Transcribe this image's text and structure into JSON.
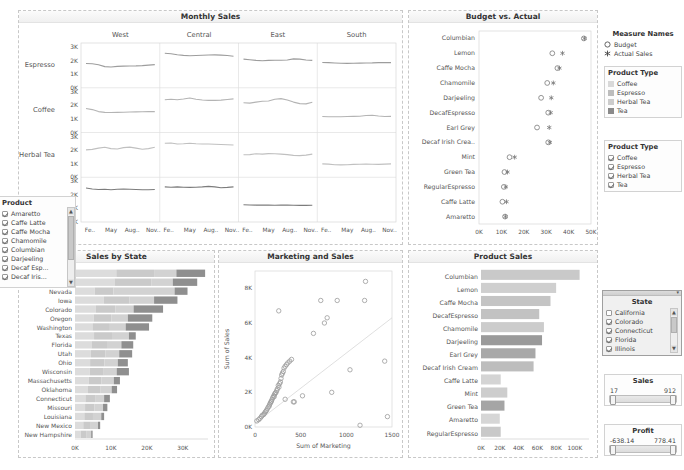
{
  "panels": {
    "monthly_sales": {
      "title": "Monthly Sales"
    },
    "budget_actual": {
      "title": "Budget vs. Actual"
    },
    "sales_by_state": {
      "title": "Sales by State"
    },
    "marketing_sales": {
      "title": "Marketing and Sales"
    },
    "product_sales": {
      "title": "Product Sales"
    }
  },
  "sidebar": {
    "measure_names": {
      "title": "Measure Names",
      "items": [
        {
          "label": "Budget",
          "icon": "hollow-circle-icon"
        },
        {
          "label": "Actual Sales",
          "icon": "asterisk-icon"
        }
      ]
    },
    "product_type_legend": {
      "title": "Product Type",
      "items": [
        {
          "label": "Coffee",
          "color": "#d9d9d9"
        },
        {
          "label": "Espresso",
          "color": "#bdbdbd"
        },
        {
          "label": "Herbal Tea",
          "color": "#cccccc"
        },
        {
          "label": "Tea",
          "color": "#8a8a8a"
        }
      ]
    },
    "product_type_filter": {
      "title": "Product Type",
      "items": [
        {
          "label": "Coffee",
          "checked": true
        },
        {
          "label": "Espresso",
          "checked": true
        },
        {
          "label": "Herbal Tea",
          "checked": true
        },
        {
          "label": "Tea",
          "checked": true
        }
      ]
    },
    "product_filter": {
      "title": "Product",
      "items": [
        {
          "label": "Amaretto",
          "checked": true
        },
        {
          "label": "Caffe Latte",
          "checked": true
        },
        {
          "label": "Caffe Mocha",
          "checked": true
        },
        {
          "label": "Chamomile",
          "checked": true
        },
        {
          "label": "Columbian",
          "checked": true
        },
        {
          "label": "Darjeeling",
          "checked": true
        },
        {
          "label": "Decaf Esp...",
          "checked": true
        },
        {
          "label": "Decaf Iris...",
          "checked": true
        }
      ]
    },
    "state_filter": {
      "title": "State",
      "items": [
        {
          "label": "California",
          "checked": false
        },
        {
          "label": "Colorado",
          "checked": true
        },
        {
          "label": "Connecticut",
          "checked": true
        },
        {
          "label": "Florida",
          "checked": true
        },
        {
          "label": "Illinois",
          "checked": true
        }
      ]
    },
    "sales_slider": {
      "title": "Sales",
      "min": "17",
      "max": "912"
    },
    "profit_slider": {
      "title": "Profit",
      "min": "-638.14",
      "max": "778.41"
    }
  },
  "chart_data": [
    {
      "type": "line",
      "name": "monthly_sales",
      "title": "Monthly Sales",
      "columns": [
        "West",
        "Central",
        "East",
        "South"
      ],
      "rows": [
        "Espresso",
        "Coffee",
        "Herbal Tea",
        "Tea"
      ],
      "xlabel": "",
      "ylabel": "",
      "ylim": [
        0,
        3000
      ],
      "yticks": [
        "0K",
        "1K",
        "2K",
        "3K"
      ],
      "xticks": [
        "Fe..",
        "May",
        "Aug..",
        "Nov.."
      ],
      "grid": false,
      "series": [
        {
          "row": "Espresso",
          "col": "West",
          "values": [
            1720,
            1700,
            1620,
            1480,
            1450,
            1500,
            1520,
            1530,
            1540,
            1560,
            1600,
            1640
          ]
        },
        {
          "row": "Espresso",
          "col": "Central",
          "values": [
            2520,
            2480,
            2400,
            2350,
            2330,
            2340,
            2360,
            2380,
            2390,
            2370,
            2340,
            2280
          ]
        },
        {
          "row": "Espresso",
          "col": "East",
          "values": [
            2060,
            2020,
            1960,
            1940,
            1960,
            1980,
            1970,
            1990,
            2080,
            2060,
            1990,
            1960
          ]
        },
        {
          "row": "Espresso",
          "col": "South",
          "values": [
            1800,
            1790,
            1760,
            1740,
            1730,
            1740,
            1750,
            1760,
            1770,
            1790,
            1800,
            1790
          ]
        },
        {
          "row": "Coffee",
          "col": "West",
          "values": [
            1700,
            1620,
            1460,
            1400,
            1390,
            1400,
            1420,
            1430,
            1440,
            1450,
            1460,
            1460
          ]
        },
        {
          "row": "Coffee",
          "col": "Central",
          "values": [
            2380,
            2420,
            2380,
            2440,
            2520,
            2420,
            2360,
            2330,
            2330,
            2350,
            2400,
            2450
          ]
        },
        {
          "row": "Coffee",
          "col": "East",
          "values": [
            2150,
            2120,
            2200,
            2260,
            2280,
            2420,
            2470,
            2360,
            2200,
            2080,
            2060,
            2180
          ]
        },
        {
          "row": "Coffee",
          "col": "South",
          "values": [
            1080,
            1060,
            1060,
            1070,
            1080,
            1090,
            1110,
            1160,
            1180,
            1120,
            1080,
            1090
          ]
        },
        {
          "row": "Herbal Tea",
          "col": "West",
          "values": [
            1960,
            2000,
            2100,
            2160,
            2060,
            2030,
            2140,
            2180,
            2100,
            2020,
            2060,
            2160
          ]
        },
        {
          "row": "Herbal Tea",
          "col": "Central",
          "values": [
            2480,
            2500,
            2420,
            2440,
            2480,
            2440,
            2420,
            2420,
            2400,
            2380,
            2360,
            2340
          ]
        },
        {
          "row": "Herbal Tea",
          "col": "East",
          "values": [
            1580,
            1600,
            1660,
            1640,
            1680,
            1660,
            1640,
            1600,
            1540,
            1520,
            1560,
            1640
          ]
        },
        {
          "row": "Herbal Tea",
          "col": "South",
          "values": [
            880,
            860,
            820,
            800,
            820,
            840,
            850,
            860,
            850,
            840,
            860,
            880
          ]
        },
        {
          "row": "Tea",
          "col": "West",
          "values": [
            2480,
            2400,
            2360,
            2380,
            2340,
            2380,
            2400,
            2380,
            2360,
            2340,
            2340,
            2360
          ]
        },
        {
          "row": "Tea",
          "col": "Central",
          "values": [
            2560,
            2540,
            2560,
            2540,
            2520,
            2540,
            2560,
            2600,
            2560,
            2500,
            2520,
            2560
          ]
        },
        {
          "row": "Tea",
          "col": "East",
          "values": [
            1180,
            1160,
            1150,
            1160,
            1150,
            1140,
            1160,
            1150,
            1140,
            1130,
            1130,
            1140
          ]
        },
        {
          "row": "Tea",
          "col": "South",
          "values": []
        }
      ]
    },
    {
      "type": "scatter",
      "name": "budget_actual",
      "title": "Budget vs. Actual",
      "categories": [
        "Columbian",
        "Lemon",
        "Caffe Mocha",
        "Chamomile",
        "Darjeeling",
        "DecafEspresso",
        "Earl Grey",
        "Decaf Irish Crea..",
        "Mint",
        "Green Tea",
        "RegularEspresso",
        "Caffe Latte",
        "Amaretto"
      ],
      "xlabel": "",
      "xlim": [
        0,
        55000
      ],
      "xticks": [
        "0K",
        "10K",
        "20K",
        "30K",
        "40K",
        "50K"
      ],
      "grid": false,
      "series": [
        {
          "name": "Budget",
          "values": [
            51500,
            36000,
            38500,
            33500,
            30500,
            34000,
            28500,
            34000,
            15000,
            12500,
            12200,
            11500,
            12800
          ]
        },
        {
          "name": "Actual Sales",
          "values": [
            51800,
            41000,
            39500,
            36500,
            35500,
            35200,
            34500,
            34800,
            17500,
            14000,
            13200,
            13500,
            13000
          ]
        }
      ]
    },
    {
      "type": "bar",
      "name": "sales_by_state",
      "title": "Sales by State",
      "orientation": "horizontal",
      "stacked": true,
      "categories": [
        "New York",
        "Illinois",
        "Nevada",
        "Iowa",
        "Colorado",
        "Oregon",
        "Washington",
        "Texas",
        "Florida",
        "Utah",
        "Ohio",
        "Wisconsin",
        "Massachusetts",
        "Oklahoma",
        "Connecticut",
        "Missouri",
        "Louisiana",
        "New Mexico",
        "New Hampshire"
      ],
      "xlabel": "",
      "xlim": [
        0,
        37000
      ],
      "xticks": [
        "0K",
        "10K",
        "20K",
        "30K"
      ],
      "grid": false,
      "series": [
        {
          "name": "Coffee",
          "values": [
            11500,
            11000,
            5500,
            8000,
            5800,
            5200,
            5000,
            5300,
            4600,
            4400,
            4200,
            4100,
            3800,
            3600,
            2900,
            2800,
            2600,
            2300,
            1600
          ]
        },
        {
          "name": "Espresso",
          "values": [
            10500,
            10200,
            5200,
            7200,
            5400,
            4900,
            4700,
            5000,
            4300,
            4100,
            4000,
            3900,
            3600,
            3400,
            2700,
            2600,
            2400,
            2100,
            1500
          ]
        },
        {
          "name": "Herbal Tea",
          "values": [
            6200,
            6000,
            17000,
            6800,
            5100,
            4600,
            4400,
            4700,
            4000,
            3800,
            3700,
            3600,
            3400,
            3200,
            2500,
            2400,
            2300,
            2000,
            1400
          ]
        },
        {
          "name": "Tea",
          "values": [
            8000,
            6800,
            3600,
            6500,
            8200,
            6800,
            6500,
            1900,
            3300,
            3600,
            2800,
            3400,
            1700,
            1500,
            1600,
            1200,
            800,
            600,
            400
          ]
        }
      ]
    },
    {
      "type": "scatter",
      "name": "marketing_sales",
      "title": "Marketing and Sales",
      "xlabel": "Sum of Marketing",
      "ylabel": "Sum of Sales",
      "xlim": [
        0,
        1500
      ],
      "ylim": [
        0,
        9000
      ],
      "xticks": [
        "0",
        "500",
        "1000",
        "1500"
      ],
      "yticks": [
        "0K",
        "2K",
        "4K",
        "6K",
        "8K"
      ],
      "grid": false,
      "trendline": true,
      "points": [
        [
          20,
          350
        ],
        [
          40,
          420
        ],
        [
          55,
          500
        ],
        [
          70,
          600
        ],
        [
          80,
          680
        ],
        [
          95,
          720
        ],
        [
          105,
          800
        ],
        [
          115,
          880
        ],
        [
          125,
          950
        ],
        [
          135,
          1050
        ],
        [
          145,
          1150
        ],
        [
          155,
          1200
        ],
        [
          160,
          1300
        ],
        [
          168,
          1380
        ],
        [
          175,
          1450
        ],
        [
          180,
          1500
        ],
        [
          188,
          1600
        ],
        [
          195,
          1700
        ],
        [
          205,
          1800
        ],
        [
          210,
          1750
        ],
        [
          215,
          1900
        ],
        [
          222,
          1950
        ],
        [
          230,
          2000
        ],
        [
          238,
          2100
        ],
        [
          245,
          2200
        ],
        [
          255,
          2400
        ],
        [
          262,
          2300
        ],
        [
          270,
          2500
        ],
        [
          278,
          2600
        ],
        [
          285,
          2800
        ],
        [
          292,
          3000
        ],
        [
          300,
          3100
        ],
        [
          310,
          3200
        ],
        [
          318,
          3400
        ],
        [
          330,
          3500
        ],
        [
          345,
          3600
        ],
        [
          360,
          3700
        ],
        [
          380,
          3800
        ],
        [
          400,
          3900
        ],
        [
          260,
          6700
        ],
        [
          330,
          1600
        ],
        [
          420,
          1450
        ],
        [
          430,
          1450
        ],
        [
          520,
          1800
        ],
        [
          640,
          5400
        ],
        [
          720,
          7300
        ],
        [
          760,
          6000
        ],
        [
          790,
          6300
        ],
        [
          840,
          2000
        ],
        [
          900,
          7300
        ],
        [
          1040,
          3300
        ],
        [
          1150,
          100
        ],
        [
          1200,
          7300
        ],
        [
          1210,
          8400
        ],
        [
          1420,
          3800
        ],
        [
          1450,
          600
        ]
      ]
    },
    {
      "type": "bar",
      "name": "product_sales",
      "title": "Product Sales",
      "orientation": "horizontal",
      "categories": [
        "Columbian",
        "Lemon",
        "Caffe Mocha",
        "DecafEspresso",
        "Chamomile",
        "Darjeeling",
        "Earl Grey",
        "Decaf Irish Cream",
        "Caffe Latte",
        "Mint",
        "Green Tea",
        "Amaretto",
        "RegularEspresso"
      ],
      "xlabel": "",
      "xlim": [
        0,
        115000
      ],
      "xticks": [
        "0K",
        "20K",
        "40K",
        "60K",
        "80K",
        "100K"
      ],
      "grid": false,
      "values": [
        105000,
        80000,
        74000,
        62000,
        67000,
        65000,
        58000,
        56000,
        21000,
        28000,
        25000,
        20000,
        21000
      ],
      "colors": [
        "#c9c9c9",
        "#cfcfcf",
        "#c4c4c4",
        "#c2c2c2",
        "#cccccc",
        "#9a9a9a",
        "#a8a8a8",
        "#bdbdbd",
        "#d4d4d4",
        "#cdcdcd",
        "#a5a5a5",
        "#d6d6d6",
        "#c9c9c9"
      ]
    }
  ]
}
